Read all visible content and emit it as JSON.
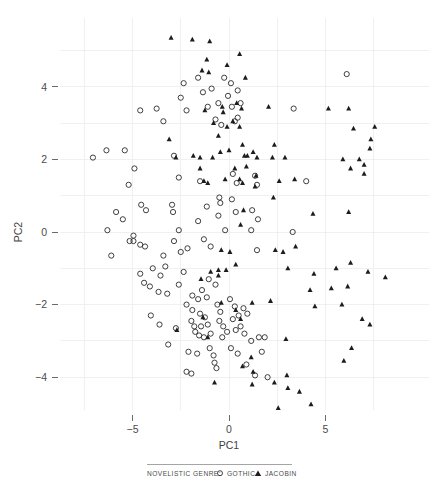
{
  "chart_data": {
    "type": "scatter",
    "title": "",
    "xlabel": "PC1",
    "ylabel": "PC2",
    "xlim": [
      -8.2,
      9.2
    ],
    "ylim": [
      -5.5,
      5.6
    ],
    "xticks": [
      -5,
      0,
      5
    ],
    "xticklabels": [
      "−5",
      "0",
      "5"
    ],
    "yticks": [
      4,
      2,
      0,
      -2,
      -4
    ],
    "yticklabels": [
      "4",
      "2",
      "0",
      "−2",
      "−4"
    ],
    "grid": true,
    "grid_color": "#ececed",
    "legend_position": "bottom",
    "legend_title": "NOVELISTIC GENRE:",
    "marker_color": "#1c1c1c",
    "series": [
      {
        "name": "GOTHIC",
        "marker": "open-circle",
        "points": [
          [
            -7.05,
            2.05
          ],
          [
            -6.35,
            2.25
          ],
          [
            -5.4,
            2.25
          ],
          [
            -5.85,
            0.55
          ],
          [
            -6.3,
            0.05
          ],
          [
            -5.5,
            0.35
          ],
          [
            -6.1,
            -0.65
          ],
          [
            -5.15,
            -0.25
          ],
          [
            -4.9,
            1.75
          ],
          [
            -5.2,
            1.3
          ],
          [
            -4.6,
            3.35
          ],
          [
            -3.75,
            3.4
          ],
          [
            -3.4,
            3.05
          ],
          [
            -4.55,
            0.75
          ],
          [
            -4.3,
            0.6
          ],
          [
            -4.95,
            -0.1
          ],
          [
            -4.95,
            -0.25
          ],
          [
            -4.6,
            -0.35
          ],
          [
            -4.35,
            -0.4
          ],
          [
            -4.6,
            -1.15
          ],
          [
            -4.4,
            -1.4
          ],
          [
            -4.1,
            -1.5
          ],
          [
            -4.05,
            -2.3
          ],
          [
            -3.6,
            -2.55
          ],
          [
            -3.95,
            -1.0
          ],
          [
            -3.55,
            -1.2
          ],
          [
            -3.4,
            -0.65
          ],
          [
            -3.3,
            -0.95
          ],
          [
            -3.65,
            -1.65
          ],
          [
            -3.2,
            -1.7
          ],
          [
            -3.15,
            -3.1
          ],
          [
            -2.75,
            -2.65
          ],
          [
            -2.35,
            4.1
          ],
          [
            -2.5,
            3.7
          ],
          [
            -2.2,
            3.35
          ],
          [
            -2.85,
            2.1
          ],
          [
            -2.6,
            1.5
          ],
          [
            -2.95,
            0.75
          ],
          [
            -2.9,
            0.55
          ],
          [
            -2.6,
            0.05
          ],
          [
            -2.85,
            -0.25
          ],
          [
            -2.5,
            -0.55
          ],
          [
            -2.15,
            -0.45
          ],
          [
            -2.6,
            -1.45
          ],
          [
            -2.35,
            -1.1
          ],
          [
            -2.2,
            -2.0
          ],
          [
            -1.9,
            -2.15
          ],
          [
            -1.95,
            -2.45
          ],
          [
            -1.8,
            -2.6
          ],
          [
            -1.75,
            -2.75
          ],
          [
            -1.55,
            -2.85
          ],
          [
            -2.1,
            -3.3
          ],
          [
            -1.65,
            -3.35
          ],
          [
            -2.2,
            -3.85
          ],
          [
            -1.95,
            -3.9
          ],
          [
            -1.9,
            -1.75
          ],
          [
            -1.6,
            -1.85
          ],
          [
            -1.4,
            -1.6
          ],
          [
            -1.15,
            -1.8
          ],
          [
            -1.5,
            -2.25
          ],
          [
            -1.25,
            -2.35
          ],
          [
            -1.45,
            -2.6
          ],
          [
            -1.1,
            -2.55
          ],
          [
            -1.3,
            -2.9
          ],
          [
            -0.95,
            -2.8
          ],
          [
            -1.0,
            -3.2
          ],
          [
            -0.8,
            -3.4
          ],
          [
            -0.75,
            -3.6
          ],
          [
            -0.65,
            -3.75
          ],
          [
            -1.05,
            -1.3
          ],
          [
            -0.7,
            -1.45
          ],
          [
            -0.6,
            -2.0
          ],
          [
            -0.45,
            -2.2
          ],
          [
            -0.5,
            -2.45
          ],
          [
            -0.3,
            -2.6
          ],
          [
            -0.35,
            -2.9
          ],
          [
            -0.1,
            -2.75
          ],
          [
            -1.6,
            4.25
          ],
          [
            -1.35,
            3.85
          ],
          [
            -1.1,
            3.45
          ],
          [
            -1.5,
            1.4
          ],
          [
            -1.15,
            0.7
          ],
          [
            -1.6,
            0.3
          ],
          [
            -1.3,
            -0.2
          ],
          [
            -0.95,
            -0.4
          ],
          [
            -0.9,
            3.95
          ],
          [
            -0.55,
            3.55
          ],
          [
            -0.7,
            3.1
          ],
          [
            -0.4,
            2.95
          ],
          [
            -0.5,
            0.95
          ],
          [
            -0.45,
            0.8
          ],
          [
            -0.55,
            0.45
          ],
          [
            -0.2,
            0.05
          ],
          [
            -0.25,
            4.25
          ],
          [
            -0.05,
            3.75
          ],
          [
            0.15,
            3.45
          ],
          [
            0.3,
            3.05
          ],
          [
            0.1,
            4.1
          ],
          [
            0.45,
            3.9
          ],
          [
            0.6,
            3.55
          ],
          [
            0.45,
            3.15
          ],
          [
            0.2,
            1.6
          ],
          [
            0.4,
            1.35
          ],
          [
            0.15,
            0.9
          ],
          [
            0.35,
            0.55
          ],
          [
            0.05,
            -1.85
          ],
          [
            0.3,
            -2.05
          ],
          [
            0.2,
            -2.4
          ],
          [
            0.5,
            -2.3
          ],
          [
            0.35,
            -2.7
          ],
          [
            0.6,
            -2.6
          ],
          [
            0.1,
            -3.2
          ],
          [
            0.45,
            -3.35
          ],
          [
            0.75,
            -2.1
          ],
          [
            0.95,
            -2.25
          ],
          [
            0.8,
            -2.8
          ],
          [
            1.15,
            -3.0
          ],
          [
            0.9,
            -3.65
          ],
          [
            1.35,
            -3.95
          ],
          [
            1.55,
            -2.9
          ],
          [
            1.85,
            -2.9
          ],
          [
            1.7,
            -3.3
          ],
          [
            2.0,
            -4.0
          ],
          [
            1.35,
            1.55
          ],
          [
            1.45,
            1.3
          ],
          [
            1.2,
            0.6
          ],
          [
            1.5,
            0.35
          ],
          [
            1.15,
            0.05
          ],
          [
            1.45,
            -0.5
          ],
          [
            3.35,
            3.4
          ],
          [
            4.0,
            1.4
          ],
          [
            3.3,
            0.0
          ],
          [
            6.1,
            4.35
          ]
        ]
      },
      {
        "name": "JACOBIN",
        "marker": "filled-triangle",
        "points": [
          [
            -3.0,
            5.35
          ],
          [
            -1.9,
            5.3
          ],
          [
            -1.0,
            5.25
          ],
          [
            -1.15,
            4.75
          ],
          [
            -1.4,
            4.45
          ],
          [
            -1.05,
            4.4
          ],
          [
            -0.1,
            4.6
          ],
          [
            0.55,
            4.9
          ],
          [
            0.85,
            4.25
          ],
          [
            -3.1,
            2.55
          ],
          [
            -2.75,
            2.05
          ],
          [
            -1.85,
            2.1
          ],
          [
            -1.5,
            1.75
          ],
          [
            -1.25,
            3.35
          ],
          [
            -0.8,
            3.0
          ],
          [
            -0.55,
            2.65
          ],
          [
            -0.35,
            3.45
          ],
          [
            -0.3,
            3.3
          ],
          [
            -0.1,
            2.9
          ],
          [
            0.0,
            2.25
          ],
          [
            0.2,
            3.05
          ],
          [
            0.4,
            3.55
          ],
          [
            0.65,
            3.4
          ],
          [
            0.55,
            2.9
          ],
          [
            0.7,
            2.4
          ],
          [
            0.8,
            2.1
          ],
          [
            0.95,
            2.1
          ],
          [
            0.3,
            1.75
          ],
          [
            0.9,
            1.8
          ],
          [
            1.25,
            2.2
          ],
          [
            1.45,
            2.05
          ],
          [
            1.4,
            1.55
          ],
          [
            1.35,
            1.25
          ],
          [
            0.55,
            1.45
          ],
          [
            0.7,
            1.35
          ],
          [
            0.75,
            0.6
          ],
          [
            0.6,
            0.2
          ],
          [
            -0.2,
            1.45
          ],
          [
            -0.45,
            2.2
          ],
          [
            -0.85,
            2.05
          ],
          [
            -1.3,
            1.4
          ],
          [
            -1.1,
            1.35
          ],
          [
            -1.5,
            2.05
          ],
          [
            2.05,
            3.45
          ],
          [
            2.35,
            2.4
          ],
          [
            2.6,
            1.4
          ],
          [
            2.3,
            0.95
          ],
          [
            2.25,
            2.05
          ],
          [
            2.9,
            2.05
          ],
          [
            3.4,
            1.45
          ],
          [
            2.8,
            -0.55
          ],
          [
            3.05,
            -1.0
          ],
          [
            4.4,
            -1.15
          ],
          [
            5.15,
            3.4
          ],
          [
            6.2,
            3.4
          ],
          [
            6.45,
            2.85
          ],
          [
            7.55,
            2.9
          ],
          [
            5.9,
            2.0
          ],
          [
            6.3,
            1.75
          ],
          [
            6.75,
            2.0
          ],
          [
            7.0,
            1.85
          ],
          [
            7.3,
            2.3
          ],
          [
            7.0,
            1.6
          ],
          [
            7.35,
            2.55
          ],
          [
            6.2,
            0.55
          ],
          [
            5.55,
            -1.0
          ],
          [
            5.3,
            -1.55
          ],
          [
            6.3,
            -0.85
          ],
          [
            6.15,
            -1.5
          ],
          [
            7.2,
            -1.1
          ],
          [
            8.1,
            -1.25
          ],
          [
            5.85,
            -2.0
          ],
          [
            4.45,
            -2.05
          ],
          [
            4.2,
            -1.6
          ],
          [
            3.45,
            -0.4
          ],
          [
            -1.45,
            -1.3
          ],
          [
            -0.95,
            -1.1
          ],
          [
            -0.55,
            -1.05
          ],
          [
            -0.55,
            -1.2
          ],
          [
            -0.15,
            -1.05
          ],
          [
            0.35,
            -0.9
          ],
          [
            -0.4,
            -0.5
          ],
          [
            0.05,
            -0.55
          ],
          [
            -2.7,
            -2.7
          ],
          [
            -1.35,
            -2.35
          ],
          [
            -1.1,
            -2.9
          ],
          [
            -0.4,
            -1.95
          ],
          [
            0.35,
            -2.15
          ],
          [
            0.6,
            -2.4
          ],
          [
            1.2,
            -1.95
          ],
          [
            2.15,
            -1.9
          ],
          [
            2.95,
            -2.95
          ],
          [
            1.15,
            -3.45
          ],
          [
            1.25,
            -3.85
          ],
          [
            0.7,
            -3.7
          ],
          [
            -0.75,
            -4.15
          ],
          [
            1.2,
            -4.2
          ],
          [
            2.35,
            -4.15
          ],
          [
            3.0,
            -3.95
          ],
          [
            3.05,
            -4.3
          ],
          [
            3.65,
            -4.4
          ],
          [
            2.55,
            -4.85
          ],
          [
            4.25,
            -4.75
          ],
          [
            2.4,
            -0.5
          ],
          [
            4.35,
            0.5
          ],
          [
            5.95,
            -3.55
          ],
          [
            7.3,
            -2.55
          ],
          [
            6.35,
            -3.2
          ],
          [
            6.9,
            -2.4
          ]
        ]
      }
    ]
  }
}
